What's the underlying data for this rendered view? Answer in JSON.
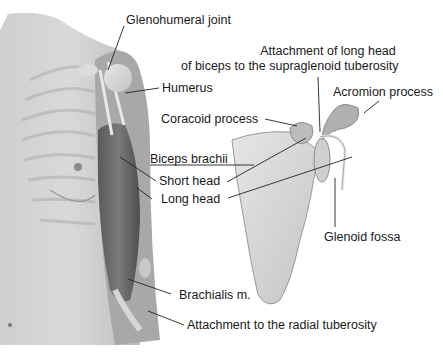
{
  "diagram": {
    "labels": {
      "glenohumeral_joint": "Glenohumeral joint",
      "attachment_long_head_1": "Attachment of long head",
      "attachment_long_head_2": "of biceps to the supraglenoid tuberosity",
      "humerus": "Humerus",
      "acromion_process": "Acromion process",
      "coracoid_process": "Coracoid process",
      "biceps_brachii": "Biceps brachii",
      "short_head": "Short head",
      "long_head": "Long head",
      "glenoid_fossa": "Glenoid fossa",
      "brachialis": "Brachialis m.",
      "radial_tuberosity": "Attachment to the radial tuberosity"
    }
  }
}
